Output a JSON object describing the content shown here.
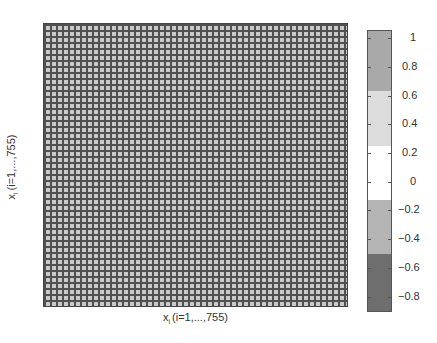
{
  "chart_data": {
    "type": "heatmap",
    "title": "",
    "xlabel": "x_i (i=1,...,755)",
    "ylabel": "x_i (i=1,...,755)",
    "xlabel_parts": {
      "var": "x",
      "sub": "i",
      "range": "(i=1,...,755)"
    },
    "ylabel_parts": {
      "var": "x",
      "sub": "i",
      "range": "(i=1,...,755)"
    },
    "matrix_size": [
      755,
      755
    ],
    "visible_grid_cells": [
      47,
      51
    ],
    "dominant_value_band": "0.6 to 0.95 (light-gray cells with dark gridlines)",
    "grid": true,
    "colorbar": {
      "position": "right",
      "range": [
        -0.9,
        1.05
      ],
      "ticks": [
        "1",
        "0.8",
        "0.6",
        "0.4",
        "0.2",
        "0",
        "−0.2",
        "−0.4",
        "−0.6",
        "−0.8"
      ],
      "tick_values": [
        1,
        0.8,
        0.6,
        0.4,
        0.2,
        0,
        -0.2,
        -0.4,
        -0.6,
        -0.8
      ],
      "bands": [
        {
          "from": 0.63,
          "to": 1.05,
          "color": "#a9a9a9"
        },
        {
          "from": 0.25,
          "to": 0.63,
          "color": "#dcdcdc"
        },
        {
          "from": -0.13,
          "to": 0.25,
          "color": "#ffffff"
        },
        {
          "from": -0.5,
          "to": -0.13,
          "color": "#b4b4b4"
        },
        {
          "from": -0.9,
          "to": -0.5,
          "color": "#6e6e6e"
        }
      ]
    }
  }
}
